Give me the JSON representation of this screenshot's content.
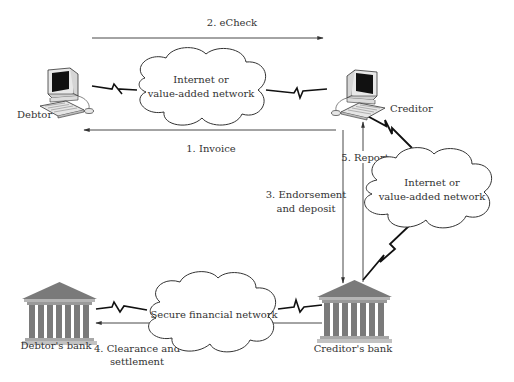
{
  "diagram": {
    "nodes": {
      "debtor": {
        "label": "Debtor",
        "type": "computer"
      },
      "creditor": {
        "label": "Creditor",
        "type": "computer"
      },
      "debtors_bank": {
        "label": "Debtor's bank",
        "type": "bank"
      },
      "creditors_bank": {
        "label": "Creditor's bank",
        "type": "bank"
      },
      "cloud_top": {
        "line1": "Internet or",
        "line2": "value-added network",
        "type": "cloud"
      },
      "cloud_right": {
        "line1": "Internet or",
        "line2": "value-added network",
        "type": "cloud"
      },
      "cloud_bottom": {
        "line1": "Secure financial network",
        "type": "cloud"
      }
    },
    "edges": {
      "invoice": {
        "label": "1. Invoice",
        "from": "Creditor",
        "to": "Debtor"
      },
      "echeck": {
        "label": "2. eCheck",
        "from": "Debtor",
        "to": "Creditor"
      },
      "endorsement": {
        "line1": "3. Endorsement",
        "line2": "and deposit",
        "from": "Creditor",
        "to": "Creditor's bank"
      },
      "clearance": {
        "line1": "4. Clearance and",
        "line2": "settlement",
        "from": "Creditor's bank",
        "to": "Debtor's bank"
      },
      "report": {
        "label": "5. Report",
        "from": "Creditor's bank",
        "to": "Creditor"
      }
    },
    "colors": {
      "line": "#333333",
      "bank_fill": "#7a7a7a",
      "bank_light": "#b5b5b5",
      "screen": "#111111",
      "cloud_stroke": "#333333"
    }
  }
}
